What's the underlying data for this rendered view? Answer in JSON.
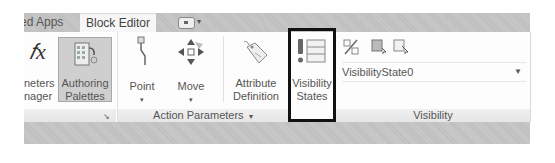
{
  "tabs": {
    "inactive_label": "red Apps",
    "active_label": "Block Editor"
  },
  "quick_access": {
    "icon": "window-switch-icon"
  },
  "panels": {
    "manage": {
      "buttons": [
        {
          "label_line1": "neters",
          "label_line2": "nager",
          "icon": "fx-icon"
        },
        {
          "label_line1": "Authoring",
          "label_line2": "Palettes",
          "icon": "authoring-palettes-icon"
        }
      ],
      "launcher": "↘"
    },
    "action_parameters": {
      "title": "Action Parameters",
      "buttons": [
        {
          "label": "Point",
          "icon": "point-parameter-icon"
        },
        {
          "label": "Move",
          "icon": "move-action-icon"
        },
        {
          "label_line1": "Attribute",
          "label_line2": "Definition",
          "icon": "attribute-tag-icon"
        }
      ]
    },
    "visibility": {
      "title": "Visibility",
      "states_button": {
        "label_line1": "Visibility",
        "label_line2": "States",
        "icon": "visibility-states-icon"
      },
      "small_buttons": [
        "make-visible-invisible-icon",
        "visibility-mode-icon",
        "visibility-select-icon"
      ],
      "dropdown_value": "VisibilityState0"
    }
  },
  "colors": {
    "highlight_border": "#111111",
    "active_button_bg": "#cfcfcf"
  }
}
